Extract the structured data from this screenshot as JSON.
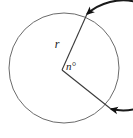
{
  "figure": {
    "type": "geometry-diagram",
    "background_color": "#ffffff",
    "canvas": {
      "width": 133,
      "height": 138
    },
    "circle": {
      "center_x": 64,
      "center_y": 68,
      "radius": 55,
      "stroke_color": "#6b6b6b",
      "stroke_width": 1
    },
    "center_point": {
      "x": 62,
      "y": 70
    },
    "radii": [
      {
        "name": "upper-radius",
        "label": "r",
        "from_x": 62,
        "from_y": 70,
        "to_x": 87,
        "to_y": 14,
        "stroke_color": "#3a3a3a",
        "stroke_width": 1
      },
      {
        "name": "lower-radius",
        "label": "",
        "from_x": 62,
        "from_y": 70,
        "to_x": 111,
        "to_y": 109,
        "stroke_color": "#3a3a3a",
        "stroke_width": 1
      }
    ],
    "arc": {
      "name": "major-arc",
      "start_x": 87,
      "start_y": 14,
      "end_x": 111,
      "end_y": 109,
      "sweep": "clockwise-major",
      "stroke_color": "#1a1a1a",
      "stroke_width": 2,
      "arrowheads": "both"
    },
    "labels": {
      "radius_label": {
        "text": "r",
        "x": 57,
        "y": 48,
        "font_size": 12,
        "color": "#1a1a1a"
      },
      "angle_label": {
        "text": "n°",
        "x": 66,
        "y": 70,
        "font_size": 11,
        "color": "#1a1a1a"
      }
    }
  }
}
